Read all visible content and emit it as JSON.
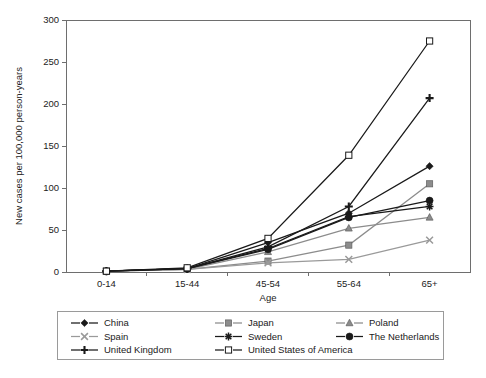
{
  "chart_data": {
    "type": "line",
    "title": "",
    "xlabel": "Age",
    "ylabel": "New cases per 100,000 person-years",
    "categories": [
      "0-14",
      "15-44",
      "45-54",
      "55-64",
      "65+"
    ],
    "ylim": [
      0,
      300
    ],
    "yticks": [
      0,
      50,
      100,
      150,
      200,
      250,
      300
    ],
    "ytick_labels": [
      "0",
      "50",
      "100",
      "150",
      "200",
      "250",
      "300"
    ],
    "grid": false,
    "legend_position": "below-plot",
    "series": [
      {
        "name": "China",
        "values": [
          1,
          4,
          35,
          70,
          126
        ],
        "color": "#1a1a1a",
        "marker": "diamond-filled"
      },
      {
        "name": "Japan",
        "values": [
          1,
          3,
          13,
          32,
          105
        ],
        "color": "#8c8c8c",
        "marker": "square-filled"
      },
      {
        "name": "Poland",
        "values": [
          1,
          3,
          24,
          52,
          65
        ],
        "color": "#8c8c8c",
        "marker": "triangle-filled"
      },
      {
        "name": "Spain",
        "values": [
          1,
          3,
          11,
          15,
          38
        ],
        "color": "#9a9a9a",
        "marker": "x-cross"
      },
      {
        "name": "Sweden",
        "values": [
          1,
          4,
          28,
          66,
          78
        ],
        "color": "#1a1a1a",
        "marker": "asterisk"
      },
      {
        "name": "The Netherlands",
        "values": [
          1,
          4,
          27,
          65,
          85
        ],
        "color": "#1a1a1a",
        "marker": "circle-filled"
      },
      {
        "name": "United Kingdom",
        "values": [
          1,
          4,
          30,
          78,
          207
        ],
        "color": "#1a1a1a",
        "marker": "plus"
      },
      {
        "name": "United States of America",
        "values": [
          1,
          5,
          40,
          139,
          275
        ],
        "color": "#1a1a1a",
        "marker": "square-open"
      }
    ]
  },
  "legend": {
    "entries": [
      {
        "label": "China",
        "row": 0,
        "col": 0
      },
      {
        "label": "Japan",
        "row": 0,
        "col": 1
      },
      {
        "label": "Poland",
        "row": 0,
        "col": 2
      },
      {
        "label": "Spain",
        "row": 1,
        "col": 0
      },
      {
        "label": "Sweden",
        "row": 1,
        "col": 1
      },
      {
        "label": "The Netherlands",
        "row": 1,
        "col": 2
      },
      {
        "label": "United Kingdom",
        "row": 2,
        "col": 0
      },
      {
        "label": "United States of America",
        "row": 2,
        "col": 1
      }
    ]
  },
  "colors": {
    "black": "#1a1a1a",
    "gray": "#8c8c8c",
    "light_gray": "#9a9a9a",
    "axis": "#6e6e6e",
    "legend_border": "#9a9a9a",
    "background": "#ffffff"
  }
}
